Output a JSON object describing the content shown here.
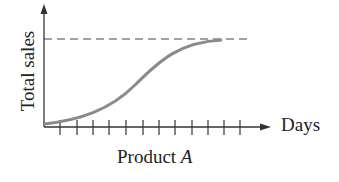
{
  "diagram": {
    "y_axis_label": "Total sales",
    "x_axis_label": "Days",
    "caption_prefix": "Product ",
    "caption_italic": "A",
    "tick_count": 12,
    "curve_type": "logistic S-curve approaching dashed asymptote",
    "asymptote": "dashed horizontal line (saturation level)",
    "colors": {
      "axis": "#333333",
      "curve": "#8a8a8a",
      "dashed": "#444444",
      "text": "#222222"
    }
  }
}
